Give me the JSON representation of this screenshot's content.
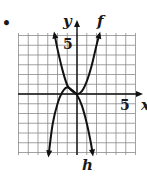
{
  "bullet": "•",
  "chart_data": {
    "type": "line",
    "title": "",
    "xlabel": "x",
    "ylabel": "y",
    "xlim": [
      -6,
      6
    ],
    "ylim": [
      -6.3,
      6.2
    ],
    "grid": true,
    "x_tick_label": "5",
    "y_tick_label": "5",
    "series": [
      {
        "name": "f",
        "points": [
          [
            -2.9,
            -6.2
          ],
          [
            -2.5,
            -3.1
          ],
          [
            -2,
            -1.0
          ],
          [
            -1.5,
            0.2
          ],
          [
            -1,
            0.7
          ],
          [
            -0.5,
            0.4
          ],
          [
            0,
            0
          ],
          [
            0.5,
            0.3
          ],
          [
            1,
            1.3
          ],
          [
            1.5,
            2.9
          ],
          [
            2,
            5.0
          ],
          [
            2.3,
            6.1
          ]
        ]
      },
      {
        "name": "h",
        "points": [
          [
            -2.3,
            6.1
          ],
          [
            -2,
            4.6
          ],
          [
            -1.5,
            2.5
          ],
          [
            -1,
            0.9
          ],
          [
            -0.5,
            0.3
          ],
          [
            0,
            -0.1
          ],
          [
            0.5,
            -1.2
          ],
          [
            1,
            -3.0
          ],
          [
            1.4,
            -4.9
          ],
          [
            1.6,
            -6.1
          ]
        ]
      }
    ]
  },
  "labels": {
    "y_axis": "y",
    "x_axis": "x",
    "y_tick": "5",
    "x_tick": "5",
    "f": "f",
    "h": "h"
  }
}
